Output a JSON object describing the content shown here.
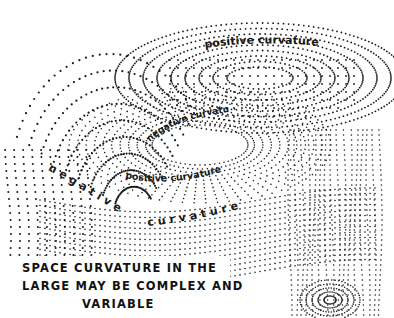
{
  "figure": {
    "ink_color": "#1a1a1a",
    "background_color": "#ffffff",
    "labels": {
      "top_positive": "positive curvature",
      "inner_negative": "negative curvature",
      "ring_positive": "positive curvature",
      "lower_negative_1": "negative",
      "lower_negative_2": "curvature"
    },
    "caption": {
      "line1": "SPACE CURVATURE IN THE",
      "line2": "LARGE MAY BE COMPLEX AND",
      "line3": "VARIABLE"
    }
  }
}
